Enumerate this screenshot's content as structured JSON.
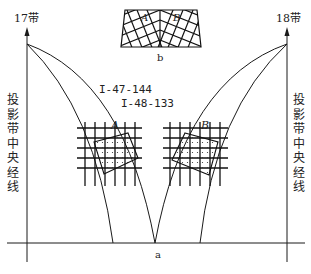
{
  "diagram": {
    "left_zone_label": "17带",
    "right_zone_label": "18带",
    "left_axis_caption": [
      "投",
      "影",
      "带",
      "中",
      "央",
      "经",
      "线"
    ],
    "right_axis_caption": [
      "投",
      "影",
      "带",
      "中",
      "央",
      "经",
      "线"
    ],
    "sheet_label_1": "I-47-144",
    "sheet_label_2": "I-48-133",
    "region_a_label": "A",
    "region_b_label": "B",
    "inset_a_label": "A",
    "inset_b_label": "B",
    "inset_caption": "b",
    "main_caption": "a",
    "line_color": "#1a1a1a"
  }
}
